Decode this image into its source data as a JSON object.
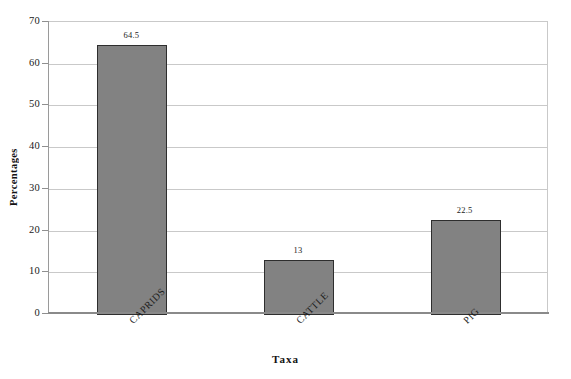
{
  "chart_data": {
    "type": "bar",
    "title": "",
    "subtitle": "",
    "xlabel": "Taxa",
    "ylabel": "Percentages",
    "categories": [
      "CAPRIDS",
      "CATTLE",
      "PIG"
    ],
    "values": [
      64.5,
      13,
      22.5
    ],
    "value_labels": [
      "64.5",
      "13",
      "22.5"
    ],
    "ylim": [
      0,
      70
    ],
    "ytick_values": [
      0,
      10,
      20,
      30,
      40,
      50,
      60,
      70
    ],
    "ytick_labels": [
      "0",
      "10",
      "20",
      "30",
      "40",
      "50",
      "60",
      "70"
    ],
    "grid": "horizontal",
    "legend": "none",
    "bar_color": "#828282",
    "bar_border_color": "#2e2e2e",
    "gridline_color": "#c9c9c9",
    "axis_color": "#8a8a8a",
    "plot_background": "#ffffff",
    "category_label_rotation": -45,
    "ylabel_rotation": 90
  }
}
